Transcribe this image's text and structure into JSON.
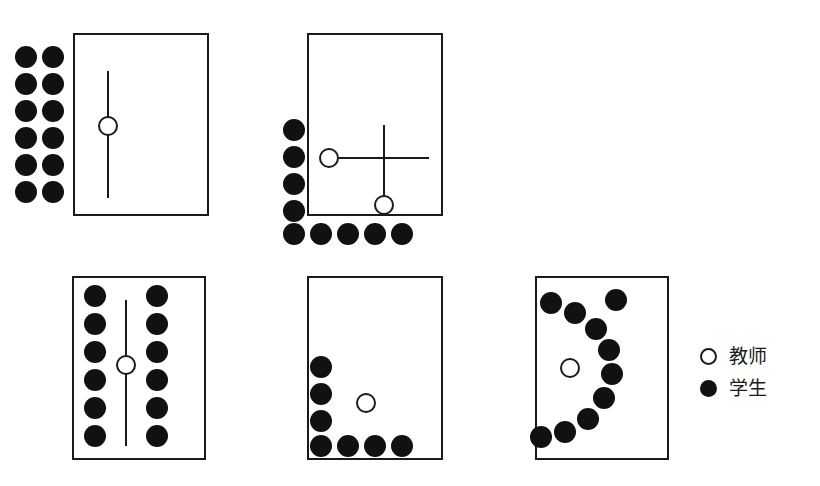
{
  "figure": {
    "background_color": "#ffffff",
    "ink_color": "#1a1a1a",
    "student_fill": "#111111",
    "teacher_fill": "#ffffff",
    "dot_diameter": 22,
    "teacher_diameter": 20
  },
  "legend": {
    "items": [
      {
        "marker": "open-circle",
        "label": "教师"
      },
      {
        "marker": "filled-circle",
        "label": "学生"
      }
    ]
  },
  "panels": [
    {
      "id": "panel-1",
      "name": "classroom-layout-1",
      "room": {
        "x": 73,
        "y": 33,
        "w": 136,
        "h": 183
      },
      "teachers": [
        {
          "x": 108,
          "y": 126
        }
      ],
      "students": [
        {
          "x": 26,
          "y": 57
        },
        {
          "x": 53,
          "y": 57
        },
        {
          "x": 26,
          "y": 84
        },
        {
          "x": 53,
          "y": 84
        },
        {
          "x": 26,
          "y": 111
        },
        {
          "x": 53,
          "y": 111
        },
        {
          "x": 26,
          "y": 138
        },
        {
          "x": 53,
          "y": 138
        },
        {
          "x": 26,
          "y": 165
        },
        {
          "x": 53,
          "y": 165
        },
        {
          "x": 26,
          "y": 192
        },
        {
          "x": 53,
          "y": 192
        }
      ],
      "lines": [
        {
          "orient": "v",
          "x": 108,
          "y1": 71,
          "y2": 198
        }
      ]
    },
    {
      "id": "panel-2",
      "name": "classroom-layout-2",
      "room": {
        "x": 307,
        "y": 33,
        "w": 136,
        "h": 183
      },
      "teachers": [
        {
          "x": 329,
          "y": 158
        },
        {
          "x": 384,
          "y": 205
        }
      ],
      "students": [
        {
          "x": 294,
          "y": 130
        },
        {
          "x": 294,
          "y": 157
        },
        {
          "x": 294,
          "y": 184
        },
        {
          "x": 294,
          "y": 211
        },
        {
          "x": 294,
          "y": 234
        },
        {
          "x": 321,
          "y": 234
        },
        {
          "x": 348,
          "y": 234
        },
        {
          "x": 375,
          "y": 234
        },
        {
          "x": 402,
          "y": 234
        }
      ],
      "lines": [
        {
          "orient": "h",
          "y": 158,
          "x1": 339,
          "x2": 429
        },
        {
          "orient": "v",
          "x": 384,
          "y1": 125,
          "y2": 198
        }
      ]
    },
    {
      "id": "panel-3",
      "name": "classroom-layout-3",
      "room": {
        "x": 72,
        "y": 276,
        "w": 134,
        "h": 184
      },
      "teachers": [
        {
          "x": 126,
          "y": 365
        }
      ],
      "students": [
        {
          "x": 95,
          "y": 296
        },
        {
          "x": 157,
          "y": 296
        },
        {
          "x": 95,
          "y": 324
        },
        {
          "x": 157,
          "y": 324
        },
        {
          "x": 95,
          "y": 352
        },
        {
          "x": 157,
          "y": 352
        },
        {
          "x": 95,
          "y": 380
        },
        {
          "x": 157,
          "y": 380
        },
        {
          "x": 95,
          "y": 408
        },
        {
          "x": 157,
          "y": 408
        },
        {
          "x": 95,
          "y": 436
        },
        {
          "x": 157,
          "y": 436
        }
      ],
      "lines": [
        {
          "orient": "v",
          "x": 126,
          "y1": 300,
          "y2": 446
        }
      ]
    },
    {
      "id": "panel-4",
      "name": "classroom-layout-4",
      "room": {
        "x": 307,
        "y": 276,
        "w": 136,
        "h": 184
      },
      "teachers": [
        {
          "x": 366,
          "y": 403
        }
      ],
      "students": [
        {
          "x": 321,
          "y": 367
        },
        {
          "x": 321,
          "y": 394
        },
        {
          "x": 321,
          "y": 421
        },
        {
          "x": 321,
          "y": 446
        },
        {
          "x": 348,
          "y": 446
        },
        {
          "x": 375,
          "y": 446
        },
        {
          "x": 402,
          "y": 446
        }
      ],
      "lines": []
    },
    {
      "id": "panel-5",
      "name": "classroom-layout-5",
      "room": {
        "x": 535,
        "y": 276,
        "w": 134,
        "h": 184
      },
      "teachers": [
        {
          "x": 570,
          "y": 368
        }
      ],
      "students": [
        {
          "x": 551,
          "y": 303
        },
        {
          "x": 575,
          "y": 313
        },
        {
          "x": 596,
          "y": 329
        },
        {
          "x": 609,
          "y": 350
        },
        {
          "x": 612,
          "y": 374
        },
        {
          "x": 604,
          "y": 398
        },
        {
          "x": 588,
          "y": 419
        },
        {
          "x": 565,
          "y": 432
        },
        {
          "x": 541,
          "y": 437
        },
        {
          "x": 616,
          "y": 300
        }
      ],
      "lines": []
    }
  ]
}
